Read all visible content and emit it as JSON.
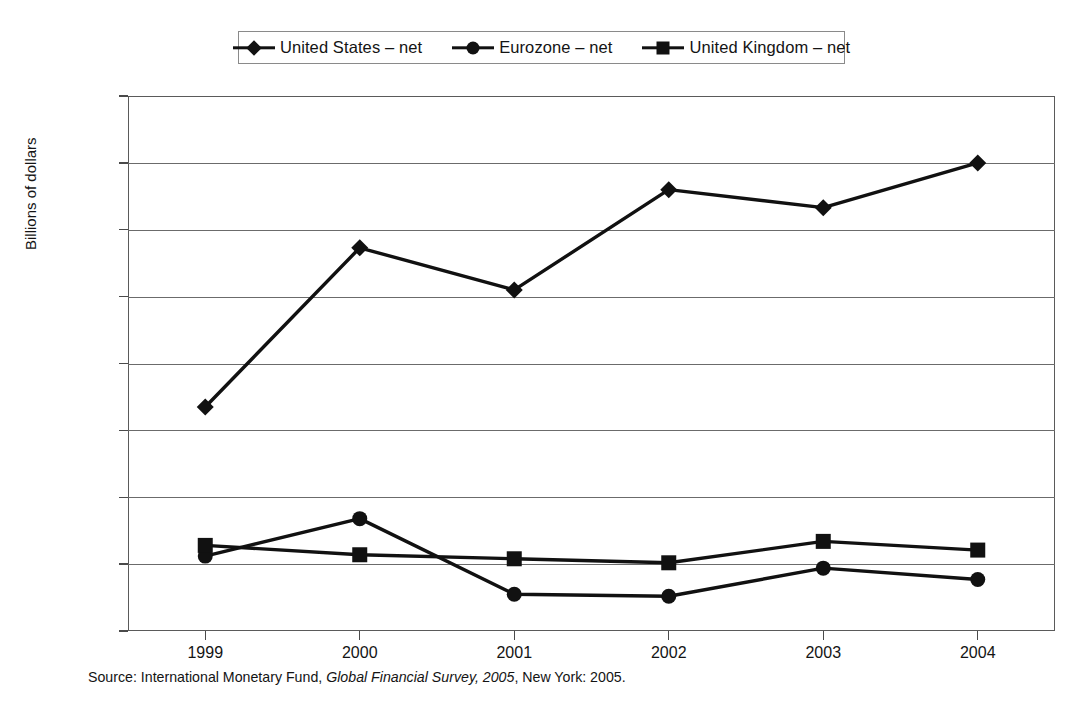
{
  "chart_data": {
    "type": "line",
    "title": "",
    "xlabel": "",
    "ylabel": "Billions of dollars",
    "categories": [
      "1999",
      "2000",
      "2001",
      "2002",
      "2003",
      "2004"
    ],
    "x": [
      1999,
      2000,
      2001,
      2002,
      2003,
      2004
    ],
    "ylim": [
      -100,
      700
    ],
    "ytick_values": [
      700,
      600,
      500,
      400,
      300,
      200,
      100,
      0,
      -100
    ],
    "ytick_labels": [
      "700",
      "600",
      "500",
      "400",
      "300",
      "200",
      "100",
      "0",
      "–100"
    ],
    "grid": true,
    "legend_position": "top-center",
    "series": [
      {
        "name": "United States – net",
        "marker": "diamond",
        "color": "#111111",
        "values": [
          235,
          473,
          410,
          560,
          533,
          600
        ]
      },
      {
        "name": "Eurozone – net",
        "marker": "circle",
        "color": "#111111",
        "values": [
          12,
          68,
          -45,
          -48,
          -6,
          -23
        ]
      },
      {
        "name": "United Kingdom – net",
        "marker": "square",
        "color": "#111111",
        "values": [
          28,
          14,
          8,
          2,
          34,
          21
        ]
      }
    ]
  },
  "legend": {
    "items": [
      {
        "label": "United States – net",
        "marker": "diamond"
      },
      {
        "label": "Eurozone – net",
        "marker": "circle"
      },
      {
        "label": "United Kingdom – net",
        "marker": "square"
      }
    ]
  },
  "source": {
    "prefix": "Source: International Monetary Fund, ",
    "italic": "Global Financial Survey, 2005",
    "suffix": ", New York: 2005."
  }
}
